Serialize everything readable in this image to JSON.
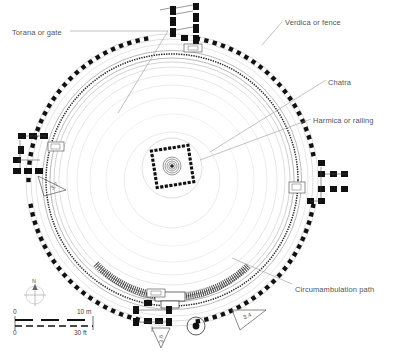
{
  "figure": {
    "type": "architectural-floor-plan"
  },
  "labels": [
    {
      "id": "torana",
      "text": "Torana or gate",
      "x": 12,
      "y": 28
    },
    {
      "id": "verdica",
      "text": "Verdica or fence",
      "x": 285,
      "y": 18
    },
    {
      "id": "chatra",
      "text": "Chatra",
      "x": 328,
      "y": 78
    },
    {
      "id": "harmica",
      "text": "Harmica or railing",
      "x": 313,
      "y": 116
    },
    {
      "id": "path",
      "text": "Circumambulation path",
      "x": 295,
      "y": 285
    }
  ],
  "scale_bar": {
    "metric": {
      "start": "0",
      "end": "10 m"
    },
    "imperial": {
      "start": "0",
      "end": "30 ft"
    }
  },
  "compass": {
    "north_label": "N"
  },
  "section_markers": [
    {
      "id": "marker-west",
      "text": "3.7",
      "x": 56,
      "y": 186
    },
    {
      "id": "marker-east",
      "text": "3.4",
      "x": 248,
      "y": 320
    },
    {
      "id": "marker-south",
      "text": "3.6",
      "x": 160,
      "y": 344
    }
  ],
  "colors": {
    "ink": "#1a1a1a",
    "fence_dot": "#111111",
    "thin_line": "#9a9a9a",
    "label_text": "#555555",
    "leader_line": "#8f8f8f",
    "background": "#ffffff"
  }
}
